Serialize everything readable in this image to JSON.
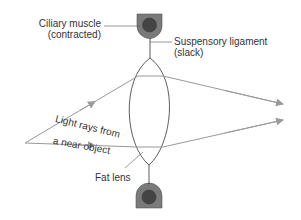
{
  "labels": {
    "ciliary_muscle": "Ciliary muscle",
    "ciliary_state": "(contracted)",
    "ligament": "Suspensory ligament",
    "ligament_state": "(slack)",
    "rays_line1": "Light rays from",
    "rays_line2": "a near object",
    "lens": "Fat lens"
  },
  "colors": {
    "muscle_outer": "#7a7a7a",
    "muscle_inner": "#444444",
    "ray": "#999999",
    "line": "#333333"
  }
}
